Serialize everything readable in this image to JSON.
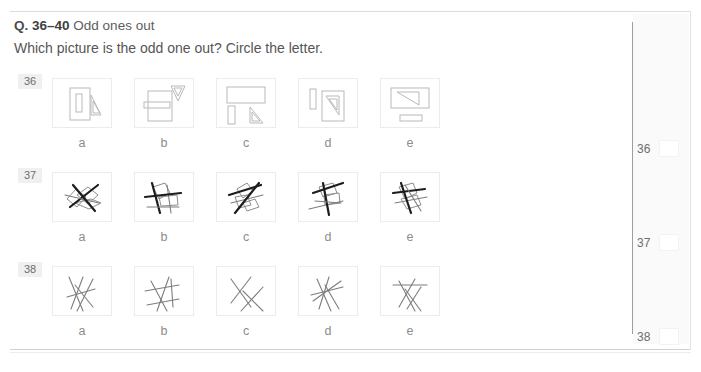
{
  "header": {
    "q_tag": "Q.",
    "q_range": "36–40",
    "q_title": "Odd ones out",
    "instruction": "Which picture is the odd one out? Circle the letter."
  },
  "option_letters": [
    "a",
    "b",
    "c",
    "d",
    "e"
  ],
  "rows": [
    {
      "number": "36",
      "top": 78,
      "letters_top": 136,
      "figures": [
        {
          "letter": "a",
          "desc": "upright-rectangle-with-inner-bar-and-small-triangle",
          "shapes": [
            {
              "t": "rect",
              "x": 17,
              "y": 9,
              "w": 20,
              "h": 32,
              "rot": 0
            },
            {
              "t": "rect",
              "x": 23,
              "y": 15,
              "w": 6,
              "h": 18,
              "rot": 0
            },
            {
              "t": "tri",
              "pts": "38,16 38,36 48,36",
              "rot": 0
            },
            {
              "t": "tri",
              "pts": "40,22 40,34 47,34",
              "rot": 0
            }
          ]
        },
        {
          "letter": "b",
          "desc": "rectangle-with-horizontal-bar-and-flag-triangle",
          "shapes": [
            {
              "t": "rect",
              "x": 13,
              "y": 12,
              "w": 24,
              "h": 30,
              "rot": 0
            },
            {
              "t": "rect",
              "x": 9,
              "y": 23,
              "w": 26,
              "h": 6,
              "rot": 0
            },
            {
              "t": "tri",
              "pts": "36,7 50,7 43,22",
              "rot": 0
            },
            {
              "t": "tri",
              "pts": "39,9 47,9 43,17",
              "rot": 0
            }
          ]
        },
        {
          "letter": "c",
          "desc": "wide-rectangle-with-bar-and-triangle-below",
          "shapes": [
            {
              "t": "rect",
              "x": 10,
              "y": 8,
              "w": 38,
              "h": 16,
              "rot": 0
            },
            {
              "t": "rect",
              "x": 11,
              "y": 27,
              "w": 7,
              "h": 18,
              "rot": 0
            },
            {
              "t": "tri",
              "pts": "33,28 33,44 46,44",
              "rot": 0
            },
            {
              "t": "tri",
              "pts": "35,33 35,42 43,42",
              "rot": 0
            }
          ]
        },
        {
          "letter": "d",
          "desc": "thin-bar-left-and-rectangle-with-triangle",
          "shapes": [
            {
              "t": "rect",
              "x": 11,
              "y": 10,
              "w": 6,
              "h": 20,
              "rot": 0
            },
            {
              "t": "rect",
              "x": 23,
              "y": 12,
              "w": 22,
              "h": 30,
              "rot": 0
            },
            {
              "t": "tri",
              "pts": "27,17 40,17 40,36",
              "rot": 0
            },
            {
              "t": "tri",
              "pts": "30,20 38,20 38,31",
              "rot": 0
            }
          ]
        },
        {
          "letter": "e",
          "desc": "wide-rectangle-with-diagonal-triangle-and-bar-below",
          "shapes": [
            {
              "t": "rect",
              "x": 10,
              "y": 9,
              "w": 38,
              "h": 20,
              "rot": 0
            },
            {
              "t": "tri",
              "pts": "16,13 38,13 38,26",
              "rot": 0
            },
            {
              "t": "rect",
              "x": 19,
              "y": 36,
              "w": 22,
              "h": 6,
              "rot": 0
            }
          ]
        }
      ]
    },
    {
      "number": "37",
      "top": 172,
      "letters_top": 230,
      "figures": [
        {
          "letter": "a",
          "desc": "tilted-quadrilaterals-with-bold-diagonal-strokes",
          "polys": [
            "14,26 23,16 33,24 24,34",
            "24,22 35,14 45,22 35,31",
            "22,30 38,26 48,30 36,36"
          ],
          "lines": [
            "17,34 45,12",
            "12,22 46,30",
            "20,12 42,38"
          ]
        },
        {
          "letter": "b",
          "desc": "upright-polygons-with-vertical-bold-strokes",
          "polys": [
            "18,14 30,10 35,20 24,26",
            "24,24 42,22 43,32 26,33"
          ],
          "lines": [
            "17,10 25,40",
            "32,12 36,40",
            "10,24 46,20",
            "12,34 44,34"
          ]
        },
        {
          "letter": "c",
          "desc": "diagonal-polygon-chain-with-bold-cross-strokes",
          "polys": [
            "20,16 30,10 36,18 26,25",
            "18,24 30,22 34,32 22,35",
            "26,30 38,26 42,34 30,38"
          ],
          "lines": [
            "12,22 44,12",
            "14,30 46,22",
            "18,40 42,10"
          ]
        },
        {
          "letter": "d",
          "desc": "polygons-with-bold-horizontal-and-diagonal-strokes",
          "polys": [
            "20,14 34,10 38,20 24,24",
            "25,22 40,20 41,30 26,32"
          ],
          "lines": [
            "14,20 44,10",
            "10,36 44,28",
            "24,10 30,42",
            "16,28 42,30"
          ]
        },
        {
          "letter": "e",
          "desc": "angular-polygons-with-bold-horizontal-strokes",
          "polys": [
            "18,14 32,10 36,20 24,26",
            "20,26 36,22 40,32 26,36"
          ],
          "lines": [
            "12,20 44,16",
            "14,30 46,24",
            "20,10 30,40",
            "24,12 40,38"
          ]
        }
      ]
    },
    {
      "number": "38",
      "top": 266,
      "letters_top": 324,
      "figures": [
        {
          "letter": "a",
          "desc": "five-crossing-straight-lines",
          "lines": [
            "16,10 30,44",
            "30,10 18,42",
            "22,18 40,40",
            "40,12 24,44",
            "14,30 42,22"
          ]
        },
        {
          "letter": "b",
          "desc": "crossing-lines-with-two-horizontals",
          "lines": [
            "16,14 32,44",
            "34,10 22,44",
            "36,12 38,40",
            "10,24 44,18",
            "12,38 44,32"
          ]
        },
        {
          "letter": "c",
          "desc": "x-shaped-crossing-line-pairs",
          "lines": [
            "14,12 34,40",
            "34,10 14,36",
            "26,24 46,44",
            "46,20 24,44"
          ]
        },
        {
          "letter": "d",
          "desc": "star-like-cluster-of-crossing-lines",
          "lines": [
            "18,12 32,44",
            "30,10 20,42",
            "12,28 44,20",
            "14,34 42,14",
            "26,18 40,42"
          ]
        },
        {
          "letter": "e",
          "desc": "crossing-lines-with-top-horizontal-and-ticks",
          "lines": [
            "18,14 34,44",
            "34,12 18,40",
            "12,18 46,18",
            "24,22 40,44",
            "40,20 26,42"
          ]
        }
      ]
    }
  ],
  "answers": [
    {
      "number": "36",
      "top": 140
    },
    {
      "number": "37",
      "top": 234
    },
    {
      "number": "38",
      "top": 328
    }
  ]
}
